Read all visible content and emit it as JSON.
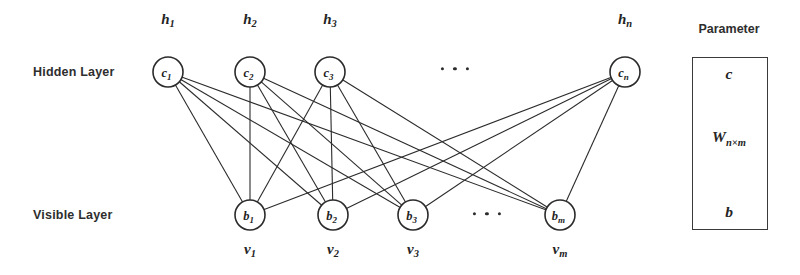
{
  "figure": {
    "type": "neural-network-diagram",
    "background_color": "#ffffff",
    "stroke_color": "#2b2b2b",
    "node_fill": "#ffffff"
  },
  "layers": {
    "hidden": {
      "label": "Hidden Layer",
      "label_x": 33,
      "label_y": 65,
      "row_y": 72,
      "node_radius": 15,
      "nodes": [
        {
          "unit": "c",
          "sub": "1",
          "top_label": "h",
          "top_sub": "1",
          "cx": 168
        },
        {
          "unit": "c",
          "sub": "2",
          "top_label": "h",
          "top_sub": "2",
          "cx": 250
        },
        {
          "unit": "c",
          "sub": "3",
          "top_label": "h",
          "top_sub": "3",
          "cx": 330
        },
        {
          "unit": "c",
          "sub": "n",
          "top_label": "h",
          "top_sub": "n",
          "cx": 625
        }
      ],
      "top_label_y": 20,
      "ellipsis": {
        "x": 455,
        "y": 69,
        "dots": 3
      }
    },
    "visible": {
      "label": "Visible Layer",
      "label_x": 33,
      "label_y": 208,
      "row_y": 215,
      "node_radius": 15,
      "nodes": [
        {
          "unit": "b",
          "sub": "1",
          "bottom_label": "v",
          "bottom_sub": "1",
          "cx": 250
        },
        {
          "unit": "b",
          "sub": "2",
          "bottom_label": "v",
          "bottom_sub": "2",
          "cx": 333
        },
        {
          "unit": "b",
          "sub": "3",
          "bottom_label": "v",
          "bottom_sub": "3",
          "cx": 413
        },
        {
          "unit": "b",
          "sub": "m",
          "bottom_label": "v",
          "bottom_sub": "m",
          "cx": 560
        }
      ],
      "bottom_label_y": 250,
      "ellipsis": {
        "x": 487,
        "y": 214,
        "dots": 3
      }
    },
    "connections": {
      "fully_connected": true,
      "edge_count": 16,
      "stroke_width": 1.1
    }
  },
  "parameter_panel": {
    "title": "Parameter",
    "title_x": 729,
    "title_y": 22,
    "box": {
      "x": 692,
      "y": 57,
      "width": 76,
      "height": 173
    },
    "entries": [
      {
        "symbol": "c",
        "sub": "",
        "x": 729,
        "y": 74
      },
      {
        "symbol": "W",
        "sub": "n×m",
        "x": 729,
        "y": 138
      },
      {
        "symbol": "b",
        "sub": "",
        "x": 729,
        "y": 212
      }
    ]
  }
}
